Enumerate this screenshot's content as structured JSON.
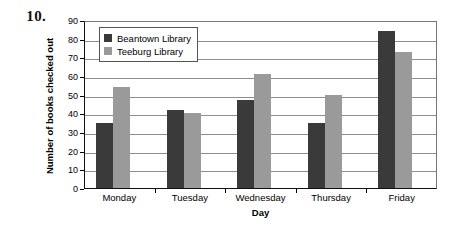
{
  "problem_number": "10.",
  "chart_data": {
    "type": "bar",
    "title": "",
    "xlabel": "Day",
    "ylabel": "Number of books checked out",
    "categories": [
      "Monday",
      "Tuesday",
      "Wednesday",
      "Thursday",
      "Friday"
    ],
    "series": [
      {
        "name": "Beantown Library",
        "values": [
          35,
          42,
          47,
          35,
          84
        ],
        "color": "#3a3a3a"
      },
      {
        "name": "Teeburg Library",
        "values": [
          54,
          40,
          61,
          50,
          73
        ],
        "color": "#9a9a9a"
      }
    ],
    "ylim": [
      0,
      90
    ],
    "ytick_step": 10,
    "yticks": [
      "90",
      "80",
      "70",
      "60",
      "50",
      "40",
      "30",
      "20",
      "10",
      "0"
    ],
    "grid": true,
    "legend_position": "inside-top-left"
  },
  "colors": {
    "series_dark": "#3a3a3a",
    "series_light": "#9a9a9a",
    "gridline": "#8d8d8d",
    "axis": "#111111",
    "plot_border": "#777777",
    "background": "#ffffff"
  }
}
